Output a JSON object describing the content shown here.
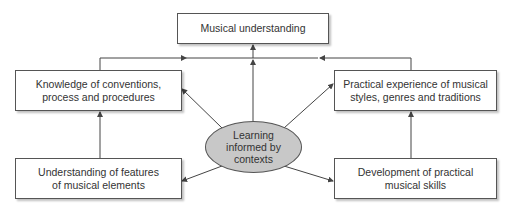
{
  "diagram": {
    "top": {
      "label": "Musical understanding"
    },
    "left": {
      "line1": "Knowledge of conventions,",
      "line2": "process and procedures"
    },
    "right": {
      "line1": "Practical experience of musical",
      "line2": "styles, genres and traditions"
    },
    "center": {
      "line1": "Learning",
      "line2": "informed by",
      "line3": "contexts"
    },
    "bottom_left": {
      "line1": "Understanding of features",
      "line2": "of musical elements"
    },
    "bottom_right": {
      "line1": "Development of practical",
      "line2": "musical skills"
    },
    "colors": {
      "line": "#444444",
      "ellipse_fill": "#c8c8c8"
    }
  }
}
